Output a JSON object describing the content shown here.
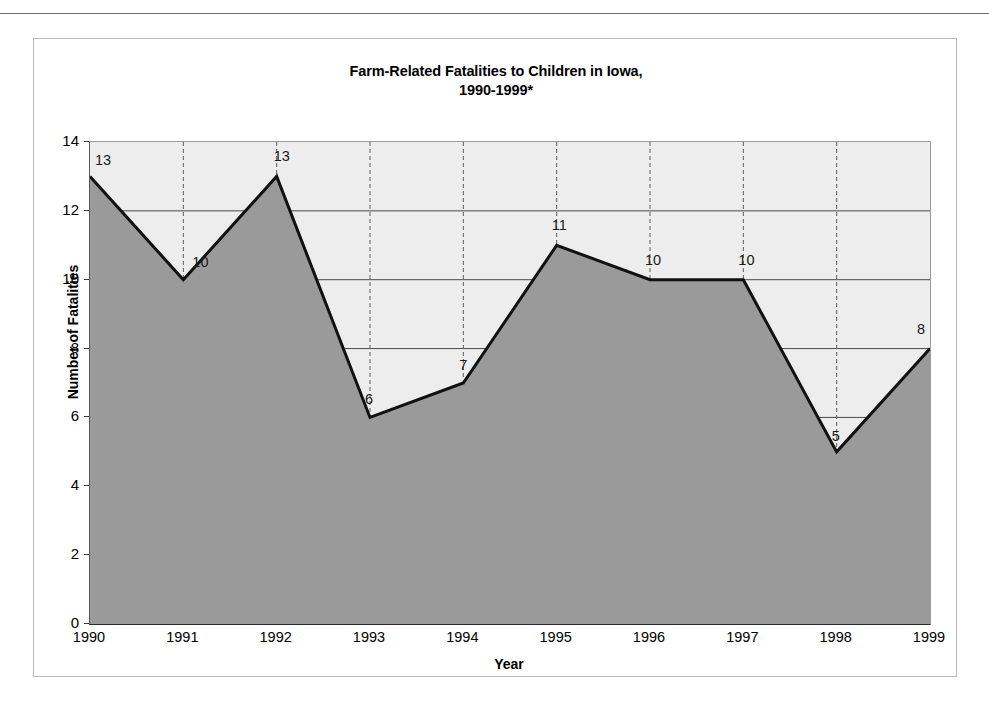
{
  "chart_data": {
    "type": "area",
    "title": "Farm-Related Fatalities to Children in Iowa,",
    "title_line2": "1990-1999*",
    "xlabel": "Year",
    "ylabel": "Number of Fatalities",
    "categories": [
      "1990",
      "1991",
      "1992",
      "1993",
      "1994",
      "1995",
      "1996",
      "1997",
      "1998",
      "1999"
    ],
    "values": [
      13,
      10,
      13,
      6,
      7,
      11,
      10,
      10,
      5,
      8
    ],
    "data_labels": [
      "13",
      "10",
      "13",
      "6",
      "7",
      "11",
      "10",
      "10",
      "5",
      "8"
    ],
    "ylim": [
      0,
      14
    ],
    "yticks": [
      "0",
      "2",
      "4",
      "6",
      "8",
      "10",
      "12",
      "14"
    ],
    "ytick_values": [
      0,
      2,
      4,
      6,
      8,
      10,
      12,
      14
    ],
    "grid": {
      "horizontal": true,
      "vertical": true,
      "vertical_style": "dashed"
    },
    "legend": "none",
    "colors": {
      "area_fill": "#9a9a9a",
      "plot_background": "#ededed",
      "line": "#111111",
      "gridline": "#4a4a4a",
      "axis": "#2b2b2b",
      "frame": "#b9b9b9"
    }
  }
}
